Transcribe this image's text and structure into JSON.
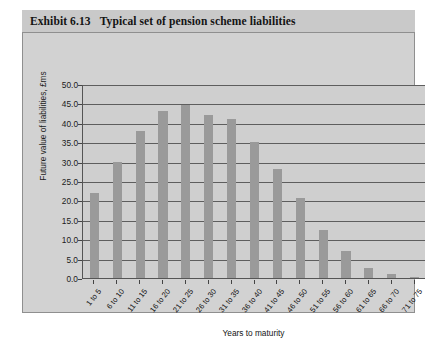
{
  "exhibit": {
    "number": "Exhibit 6.13",
    "title": "Typical set of pension scheme liabilities"
  },
  "chart_data": {
    "type": "bar",
    "title": "Typical set of pension scheme liabilities",
    "xlabel": "Years to maturity",
    "ylabel": "Future value of liabilities, £ms",
    "ylim": [
      0,
      50
    ],
    "ytick_step": 5,
    "ytick_labels": [
      "0.0",
      "5.0",
      "10.0",
      "15.0",
      "20.0",
      "25.0",
      "30.0",
      "35.0",
      "40.0",
      "45.0",
      "50.0"
    ],
    "grid": true,
    "legend": null,
    "bar_color": "#9a9a9a",
    "categories": [
      "1 to 5",
      "6 to 10",
      "11 to 15",
      "16 to 20",
      "21 to 25",
      "26 to 30",
      "31 to 35",
      "36 to 40",
      "41 to 45",
      "46 to 50",
      "51 to 55",
      "56 to 60",
      "61 to 65",
      "66 to 70",
      "71 to 75"
    ],
    "values": [
      22.0,
      30.0,
      38.0,
      43.0,
      44.5,
      42.0,
      41.0,
      35.0,
      28.0,
      20.5,
      12.5,
      7.0,
      2.5,
      1.0,
      0.3
    ]
  }
}
